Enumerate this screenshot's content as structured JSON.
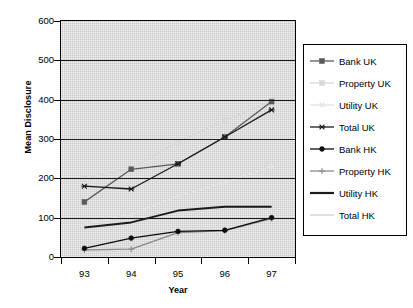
{
  "chart_data": {
    "type": "line",
    "title": "",
    "xlabel": "Year",
    "ylabel": "Mean Disclosure",
    "categories": [
      "93",
      "94",
      "95",
      "96",
      "97"
    ],
    "ylim": [
      0,
      600
    ],
    "yticks": [
      0,
      100,
      200,
      300,
      400,
      500,
      600
    ],
    "grid": true,
    "legend_position": "right",
    "series": [
      {
        "name": "Bank UK",
        "values": [
          140,
          223,
          237,
          305,
          395
        ],
        "color": "#5a5a5a",
        "marker": "square"
      },
      {
        "name": "Property UK",
        "values": [
          200,
          225,
          293,
          347,
          397
        ],
        "color": "#d9d9d9",
        "marker": "square"
      },
      {
        "name": "Utility UK",
        "values": [
          85,
          108,
          155,
          190,
          230
        ],
        "color": "#e2e2e2",
        "marker": "cross"
      },
      {
        "name": "Total UK",
        "values": [
          180,
          173,
          237,
          305,
          374
        ],
        "color": "#1a1a1a",
        "marker": "asterisk"
      },
      {
        "name": "Bank HK",
        "values": [
          22,
          48,
          65,
          68,
          100
        ],
        "color": "#0d0d0d",
        "marker": "circle"
      },
      {
        "name": "Property HK",
        "values": [
          18,
          20,
          62,
          67,
          98
        ],
        "color": "#8c8c8c",
        "marker": "plus"
      },
      {
        "name": "Utility HK",
        "values": [
          75,
          88,
          118,
          128,
          128
        ],
        "color": "#1a1a1a",
        "marker": "none"
      },
      {
        "name": "Total HK",
        "values": [
          18,
          20,
          62,
          67,
          98
        ],
        "color": "#cfcfcf",
        "marker": "none"
      }
    ]
  },
  "axes": {
    "y_title": "Mean Disclosure",
    "x_title": "Year",
    "y_tick_labels": [
      "600",
      "500",
      "400",
      "300",
      "200",
      "100",
      "0"
    ],
    "x_tick_labels": [
      "93",
      "94",
      "95",
      "96",
      "97"
    ]
  },
  "legend": {
    "items": [
      {
        "label": "Bank UK"
      },
      {
        "label": "Property UK"
      },
      {
        "label": "Utility UK"
      },
      {
        "label": "Total UK"
      },
      {
        "label": "Bank HK"
      },
      {
        "label": "Property HK"
      },
      {
        "label": "Utility HK"
      },
      {
        "label": "Total HK"
      }
    ]
  }
}
